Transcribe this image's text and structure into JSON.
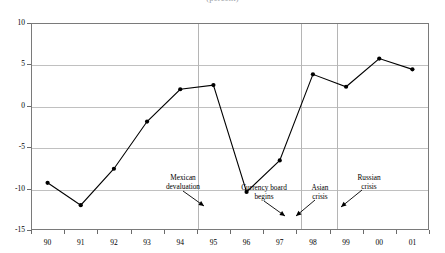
{
  "title": {
    "text": "(percent)",
    "note": "cropped-partial-title-at-top-edge"
  },
  "axes": {
    "y_ticks": [
      "10",
      "5",
      "0",
      "-5",
      "-10",
      "-15"
    ],
    "x_ticks": [
      "90",
      "91",
      "92",
      "93",
      "94",
      "95",
      "96",
      "97",
      "98",
      "99",
      "00",
      "01"
    ]
  },
  "annotations": [
    {
      "name": "mexican-devaluation",
      "line1": "Mexican",
      "line2": "devaluation"
    },
    {
      "name": "currency-board-begins",
      "line1": "Currency board",
      "line2": "begins"
    },
    {
      "name": "asian-crisis",
      "line1": "Asian",
      "line2": "crisis"
    },
    {
      "name": "russian-crisis",
      "line1": "Russian",
      "line2": "crisis"
    }
  ],
  "colors": {
    "series": "#000000",
    "grid": "#c0c0c0",
    "divider": "#b5b5b5",
    "frame": "#7a7a7a",
    "background": "#ffffff"
  },
  "chart_data": {
    "type": "line",
    "title": "(percent)",
    "xlabel": "",
    "ylabel": "",
    "categories": [
      "90",
      "91",
      "92",
      "93",
      "94",
      "95",
      "96",
      "97",
      "98",
      "99",
      "00",
      "01"
    ],
    "values": [
      -9.3,
      -12.0,
      -7.6,
      -1.9,
      2.0,
      2.5,
      -10.4,
      -6.6,
      3.8,
      2.3,
      5.7,
      4.4
    ],
    "ylim": [
      -15,
      10
    ],
    "ytick_values": [
      10,
      5,
      0,
      -5,
      -10,
      -15
    ],
    "grid": true,
    "legend": null,
    "markers": "filled-circle",
    "event_dividers": [
      {
        "label": "Mexican devaluation",
        "x_position": 4.5
      },
      {
        "label": "Asian crisis",
        "x_position": 7.6
      },
      {
        "label": "Russian crisis",
        "x_position": 8.7
      }
    ],
    "annotations": [
      {
        "text": "Mexican devaluation",
        "points_to_x": 4.5,
        "points_to_y": -12.6
      },
      {
        "text": "Currency board begins",
        "points_to_x": 6.85,
        "points_to_y": -14.0
      },
      {
        "text": "Asian crisis",
        "points_to_x": 7.6,
        "points_to_y": -14.3
      },
      {
        "text": "Russian crisis",
        "points_to_x": 8.7,
        "points_to_y": -13.5
      }
    ]
  }
}
